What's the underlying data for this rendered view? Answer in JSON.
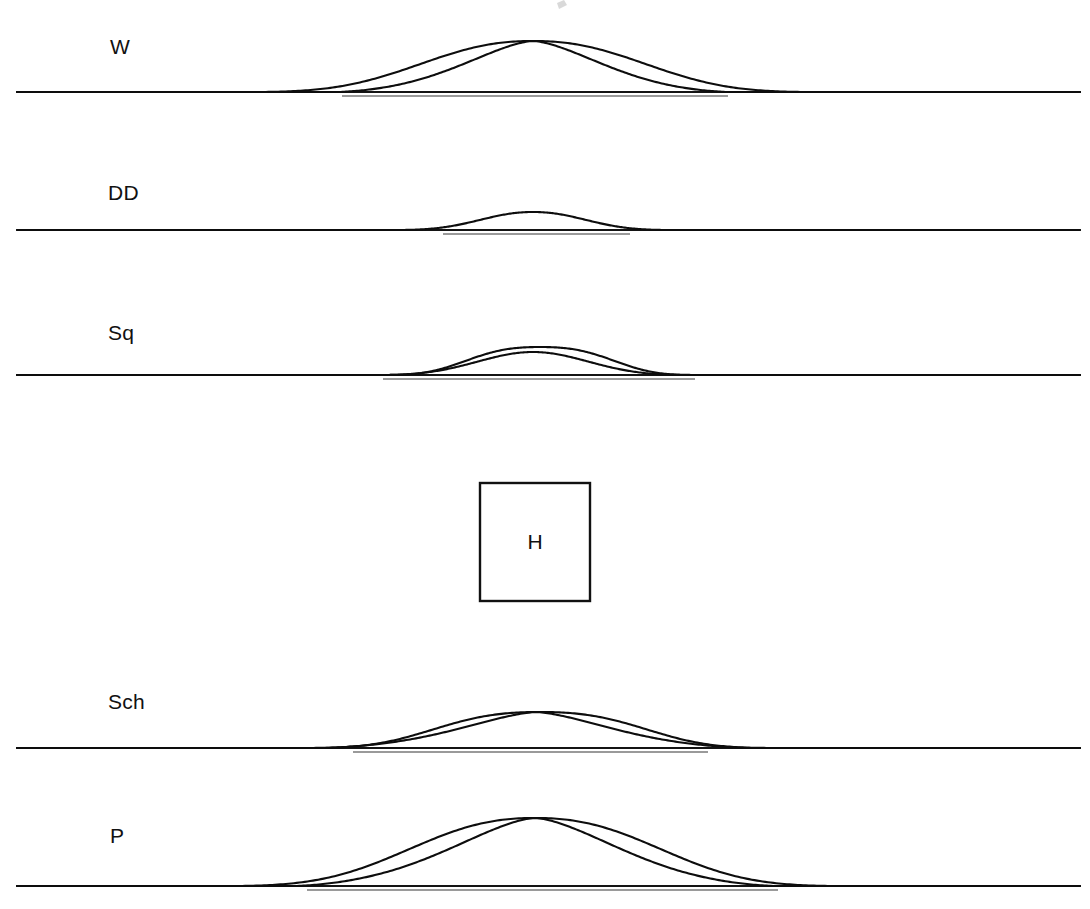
{
  "figure": {
    "title": "",
    "background_color": "#ffffff",
    "width": 1090,
    "height": 909,
    "line_color": "#0d0d0d",
    "baseline_color": "#141414",
    "underline_color": "#9a9a9a"
  },
  "center_box": {
    "label": "H",
    "x": 480,
    "y": 483,
    "width": 110,
    "height": 118,
    "stroke_color": "#111111"
  },
  "panels": [
    {
      "id": "panel-w",
      "label": "W",
      "label_x": 110,
      "label_y": 54,
      "baseline_y": 92,
      "baseline_x1": 17,
      "baseline_x2": 1080,
      "underline_x1": 342,
      "underline_x2": 728,
      "underline_y": 96,
      "curves": [
        {
          "name": "broad",
          "center": 533,
          "half_width": 272,
          "amplitude": 51,
          "shape": 2.4
        },
        {
          "name": "narrow",
          "center": 533,
          "half_width": 194,
          "amplitude": 51,
          "shape": 1.5
        }
      ]
    },
    {
      "id": "panel-dd",
      "label": "DD",
      "label_x": 108,
      "label_y": 200,
      "baseline_y": 230,
      "baseline_x1": 17,
      "baseline_x2": 1080,
      "underline_x1": 443,
      "underline_x2": 630,
      "underline_y": 234,
      "curves": [
        {
          "name": "single",
          "center": 533,
          "half_width": 133,
          "amplitude": 18,
          "shape": 2.2
        }
      ]
    },
    {
      "id": "panel-sq",
      "label": "Sq",
      "label_x": 108,
      "label_y": 340,
      "baseline_y": 375,
      "baseline_x1": 17,
      "baseline_x2": 1080,
      "underline_x1": 383,
      "underline_x2": 695,
      "underline_y": 379,
      "curves": [
        {
          "name": "broad",
          "center": 540,
          "half_width": 161,
          "amplitude": 28,
          "shape": 3.1
        },
        {
          "name": "narrow",
          "center": 533,
          "half_width": 148,
          "amplitude": 23,
          "shape": 2.0
        }
      ]
    },
    {
      "id": "panel-sch",
      "label": "Sch",
      "label_x": 108,
      "label_y": 709,
      "baseline_y": 748,
      "baseline_x1": 17,
      "baseline_x2": 1080,
      "underline_x1": 353,
      "underline_x2": 708,
      "underline_y": 752,
      "curves": [
        {
          "name": "broad",
          "center": 540,
          "half_width": 237,
          "amplitude": 36,
          "shape": 2.9
        },
        {
          "name": "narrow",
          "center": 536,
          "half_width": 213,
          "amplitude": 36,
          "shape": 1.45
        }
      ]
    },
    {
      "id": "panel-p",
      "label": "P",
      "label_x": 110,
      "label_y": 843,
      "baseline_y": 886,
      "baseline_x1": 17,
      "baseline_x2": 1080,
      "underline_x1": 307,
      "underline_x2": 778,
      "underline_y": 890,
      "curves": [
        {
          "name": "broad",
          "center": 535,
          "half_width": 298,
          "amplitude": 68,
          "shape": 2.5
        },
        {
          "name": "narrow",
          "center": 535,
          "half_width": 238,
          "amplitude": 68,
          "shape": 1.5
        }
      ]
    }
  ],
  "chart_data": {
    "type": "line",
    "title": "",
    "xlabel": "",
    "ylabel": "",
    "panel_labels": [
      "W",
      "DD",
      "Sq",
      "H",
      "Sch",
      "P"
    ],
    "series": [
      {
        "name": "W-broad",
        "panel": "W",
        "peak_amplitude_px": 51,
        "half_width_px": 272,
        "curve_count": 2
      },
      {
        "name": "W-narrow",
        "panel": "W",
        "peak_amplitude_px": 51,
        "half_width_px": 194,
        "curve_count": 2
      },
      {
        "name": "DD",
        "panel": "DD",
        "peak_amplitude_px": 18,
        "half_width_px": 133,
        "curve_count": 1
      },
      {
        "name": "Sq-broad",
        "panel": "Sq",
        "peak_amplitude_px": 28,
        "half_width_px": 161,
        "curve_count": 2
      },
      {
        "name": "Sq-narrow",
        "panel": "Sq",
        "peak_amplitude_px": 23,
        "half_width_px": 148,
        "curve_count": 2
      },
      {
        "name": "Sch-broad",
        "panel": "Sch",
        "peak_amplitude_px": 36,
        "half_width_px": 237,
        "curve_count": 2
      },
      {
        "name": "Sch-narrow",
        "panel": "Sch",
        "peak_amplitude_px": 36,
        "half_width_px": 213,
        "curve_count": 2
      },
      {
        "name": "P-broad",
        "panel": "P",
        "peak_amplitude_px": 68,
        "half_width_px": 298,
        "curve_count": 2
      },
      {
        "name": "P-narrow",
        "panel": "P",
        "peak_amplitude_px": 68,
        "half_width_px": 238,
        "curve_count": 2
      }
    ],
    "grid": false,
    "legend": "none"
  }
}
